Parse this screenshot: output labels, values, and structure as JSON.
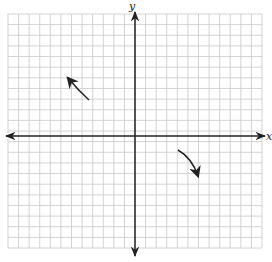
{
  "figure": {
    "type": "coordinate-grid",
    "width": 272,
    "height": 262,
    "colors": {
      "background": "#ffffff",
      "grid_line": "#c8c8c8",
      "axis": "#222222",
      "curve": "#222222"
    },
    "grid": {
      "left": 8,
      "top": 14,
      "right": 262,
      "bottom": 248,
      "cell_size": 10.6,
      "columns": 24,
      "rows": 22
    },
    "axes": {
      "origin_px": [
        135,
        136
      ],
      "x_label": "x",
      "y_label": "y",
      "x_axis_double_arrow": true,
      "y_axis_double_arrow": true
    },
    "end_behavior_arrows": [
      {
        "name": "upper-left-arrow",
        "quadrant": "II",
        "direction": "up-left",
        "description": "curve rising toward upper left"
      },
      {
        "name": "lower-right-arrow",
        "quadrant": "IV",
        "direction": "down-right",
        "description": "curve falling toward lower right"
      }
    ]
  }
}
